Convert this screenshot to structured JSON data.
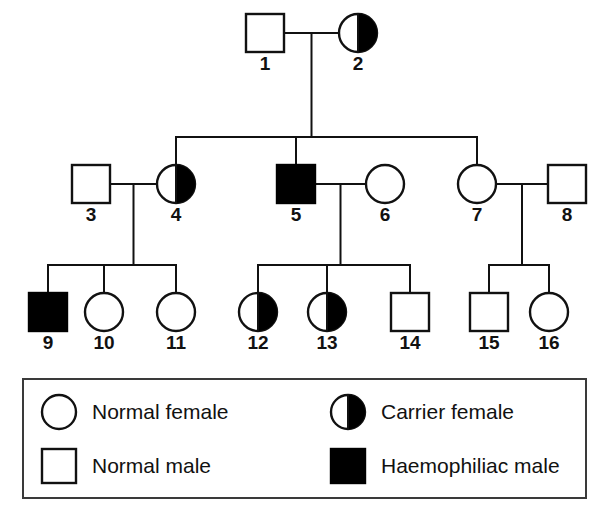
{
  "figure": {
    "kind": "pedigree-chart",
    "topic": "Haemophilia inheritance pedigree",
    "symbol_colors": {
      "outline": "#111111",
      "fill_affected": "#000000",
      "fill_normal": "#ffffff",
      "legend_border": "#3a3a3a"
    }
  },
  "chart_data": {
    "type": "diagram",
    "title": "",
    "generations": [
      {
        "name": "I",
        "members": [
          "1",
          "2"
        ]
      },
      {
        "name": "II",
        "members": [
          "3",
          "4",
          "5",
          "6",
          "7",
          "8"
        ]
      },
      {
        "name": "III",
        "members": [
          "9",
          "10",
          "11",
          "12",
          "13",
          "14",
          "15",
          "16"
        ]
      }
    ],
    "individuals": [
      {
        "id": "1",
        "label": "1",
        "sex": "male",
        "status": "normal",
        "shape": "square",
        "fill": "open",
        "x": 265,
        "y": 33,
        "generation": "I"
      },
      {
        "id": "2",
        "label": "2",
        "sex": "female",
        "status": "carrier",
        "shape": "circle",
        "fill": "half",
        "x": 358,
        "y": 33,
        "generation": "I"
      },
      {
        "id": "3",
        "label": "3",
        "sex": "male",
        "status": "normal",
        "shape": "square",
        "fill": "open",
        "x": 91,
        "y": 184,
        "generation": "II"
      },
      {
        "id": "4",
        "label": "4",
        "sex": "female",
        "status": "carrier",
        "shape": "circle",
        "fill": "half",
        "x": 176,
        "y": 184,
        "generation": "II"
      },
      {
        "id": "5",
        "label": "5",
        "sex": "male",
        "status": "affected",
        "shape": "square",
        "fill": "solid",
        "x": 296,
        "y": 184,
        "generation": "II"
      },
      {
        "id": "6",
        "label": "6",
        "sex": "female",
        "status": "normal",
        "shape": "circle",
        "fill": "open",
        "x": 385,
        "y": 184,
        "generation": "II"
      },
      {
        "id": "7",
        "label": "7",
        "sex": "female",
        "status": "normal",
        "shape": "circle",
        "fill": "open",
        "x": 477,
        "y": 184,
        "generation": "II"
      },
      {
        "id": "8",
        "label": "8",
        "sex": "male",
        "status": "normal",
        "shape": "square",
        "fill": "open",
        "x": 567,
        "y": 184,
        "generation": "II"
      },
      {
        "id": "9",
        "label": "9",
        "sex": "male",
        "status": "affected",
        "shape": "square",
        "fill": "solid",
        "x": 48,
        "y": 312,
        "generation": "III"
      },
      {
        "id": "10",
        "label": "10",
        "sex": "female",
        "status": "normal",
        "shape": "circle",
        "fill": "open",
        "x": 104,
        "y": 312,
        "generation": "III"
      },
      {
        "id": "11",
        "label": "11",
        "sex": "female",
        "status": "normal",
        "shape": "circle",
        "fill": "open",
        "x": 176,
        "y": 312,
        "generation": "III"
      },
      {
        "id": "12",
        "label": "12",
        "sex": "female",
        "status": "carrier",
        "shape": "circle",
        "fill": "half",
        "x": 258,
        "y": 312,
        "generation": "III"
      },
      {
        "id": "13",
        "label": "13",
        "sex": "female",
        "status": "carrier",
        "shape": "circle",
        "fill": "half",
        "x": 327,
        "y": 312,
        "generation": "III"
      },
      {
        "id": "14",
        "label": "14",
        "sex": "male",
        "status": "normal",
        "shape": "square",
        "fill": "open",
        "x": 410,
        "y": 312,
        "generation": "III"
      },
      {
        "id": "15",
        "label": "15",
        "sex": "male",
        "status": "normal",
        "shape": "square",
        "fill": "open",
        "x": 489,
        "y": 312,
        "generation": "III"
      },
      {
        "id": "16",
        "label": "16",
        "sex": "female",
        "status": "normal",
        "shape": "circle",
        "fill": "open",
        "x": 549,
        "y": 312,
        "generation": "III"
      }
    ],
    "matings": [
      {
        "partners": [
          "1",
          "2"
        ],
        "children": [
          "4",
          "5",
          "7"
        ]
      },
      {
        "partners": [
          "3",
          "4"
        ],
        "children": [
          "9",
          "10",
          "11"
        ]
      },
      {
        "partners": [
          "5",
          "6"
        ],
        "children": [
          "12",
          "13",
          "14"
        ]
      },
      {
        "partners": [
          "7",
          "8"
        ],
        "children": [
          "15",
          "16"
        ]
      }
    ]
  },
  "legend": {
    "title": "",
    "items": [
      {
        "symbol": "circle-open",
        "label": "Normal female"
      },
      {
        "symbol": "circle-half",
        "label": "Carrier female"
      },
      {
        "symbol": "square-open",
        "label": "Normal male"
      },
      {
        "symbol": "square-solid",
        "label": "Haemophiliac male"
      }
    ]
  }
}
